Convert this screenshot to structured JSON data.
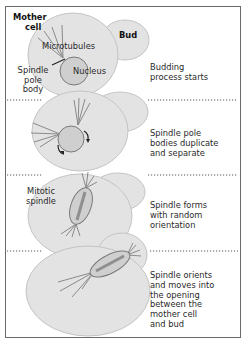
{
  "colors": {
    "cell_fill": "#e3e3e3",
    "cell_stroke": "#c4c4c4",
    "nucleus_fill": "#cfcfcf",
    "nucleus_stroke": "#7a7a7a",
    "microtubule": "#8a8a8a",
    "divider": "#555555",
    "text": "#2a2a2a"
  },
  "labels": {
    "mother_cell": "Mother cell",
    "mother_line1": "Mother",
    "mother_line2": "cell",
    "bud": "Bud",
    "microtubules": "Microtubules",
    "nucleus": "Nucleus",
    "spindle_pole_line1": "Spindle",
    "spindle_pole_line2": "pole",
    "spindle_pole_line3": "body",
    "mitotic_line1": "Mitotic",
    "mitotic_line2": "spindle"
  },
  "steps": [
    {
      "lines": [
        "Budding",
        "process starts"
      ]
    },
    {
      "lines": [
        "Spindle pole",
        "bodies duplicate",
        "and separate"
      ]
    },
    {
      "lines": [
        "Spindle forms",
        "with random",
        "orientation"
      ]
    },
    {
      "lines": [
        "Spindle orients",
        "and moves into",
        "the opening",
        "between the",
        "mother cell",
        "and bud"
      ]
    }
  ]
}
